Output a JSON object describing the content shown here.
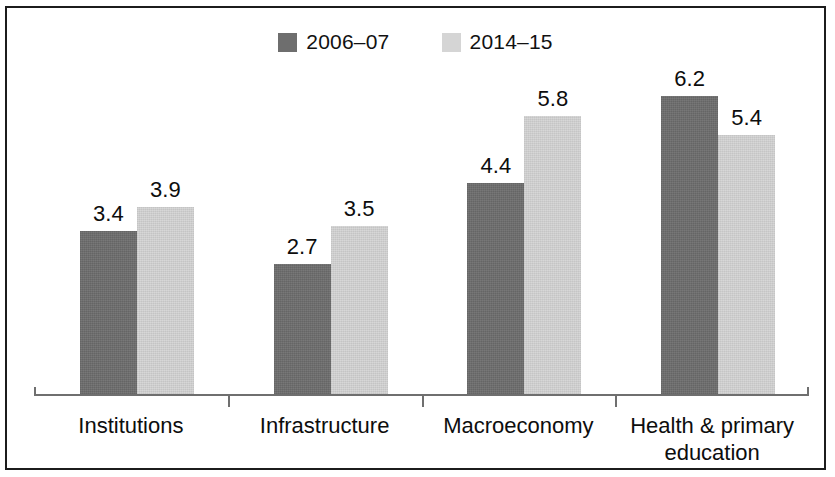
{
  "figure": {
    "border_color": "#1c1c1c",
    "background": "#ffffff"
  },
  "legend": {
    "position": "top-center",
    "entries": [
      {
        "label": "2006–07",
        "color": "#6e6e6e",
        "swatch_name": "legend-swatch-2006-07"
      },
      {
        "label": "2014–15",
        "color": "#d5d5d5",
        "swatch_name": "legend-swatch-2014-15"
      }
    ]
  },
  "axis": {
    "line_color": "#6f6f6f",
    "tick_positions_pct": [
      25,
      50,
      75
    ]
  },
  "chart_data": {
    "type": "bar",
    "title": "",
    "subtitle": "",
    "xlabel": "",
    "ylabel": "",
    "ylim": [
      0,
      7
    ],
    "grid": false,
    "legend_position": "top-center",
    "categories": [
      "Institutions",
      "Infrastructure",
      "Macroeconomy",
      "Health & primary education"
    ],
    "series": [
      {
        "name": "2006–07",
        "color": "#6e6e6e",
        "values": [
          3.4,
          2.7,
          4.4,
          6.2
        ]
      },
      {
        "name": "2014–15",
        "color": "#d5d5d5",
        "values": [
          3.9,
          3.5,
          5.8,
          5.4
        ]
      }
    ],
    "data_labels": {
      "2006–07": [
        "3.4",
        "2.7",
        "4.4",
        "6.2"
      ],
      "2014–15": [
        "3.9",
        "3.5",
        "5.8",
        "5.4"
      ]
    }
  }
}
